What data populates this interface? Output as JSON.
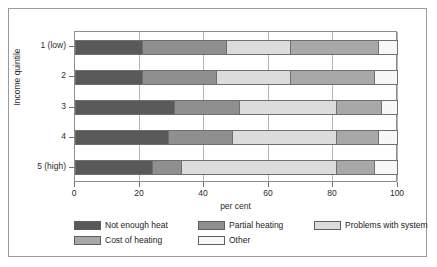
{
  "chart_data": {
    "type": "bar",
    "orientation": "horizontal",
    "stacked": true,
    "title": "",
    "xlabel": "per cent",
    "ylabel": "Income quintile",
    "xlim": [
      0,
      100
    ],
    "xticks": [
      0,
      20,
      40,
      60,
      80,
      100
    ],
    "xticklabels": [
      "0",
      "20",
      "40",
      "60",
      "80",
      "100"
    ],
    "grid": "vertical",
    "legend_position": "bottom",
    "categories": [
      "1 (low)",
      "2",
      "3",
      "4",
      "5 (high)"
    ],
    "series": [
      {
        "name": "Not enough heat",
        "color": "#595959",
        "values": [
          21,
          21,
          31,
          29,
          24
        ]
      },
      {
        "name": "Partial heating",
        "color": "#8f8f8f",
        "values": [
          26,
          23,
          20,
          20,
          9
        ]
      },
      {
        "name": "Problems with system",
        "color": "#dcdcdc",
        "values": [
          20,
          23,
          30,
          32,
          48
        ]
      },
      {
        "name": "Cost of heating",
        "color": "#a8a8a8",
        "values": [
          27,
          26,
          14,
          13,
          12
        ]
      },
      {
        "name": "Other",
        "color": "#f7f7f7",
        "values": [
          6,
          7,
          5,
          6,
          7
        ]
      }
    ]
  },
  "legend": {
    "items": [
      {
        "label": "Not enough heat",
        "color": "#595959"
      },
      {
        "label": "Partial heating",
        "color": "#8f8f8f"
      },
      {
        "label": "Problems with system",
        "color": "#dcdcdc"
      },
      {
        "label": "Cost of heating",
        "color": "#a8a8a8"
      },
      {
        "label": "Other",
        "color": "#f7f7f7"
      }
    ]
  },
  "axes": {
    "x_title": "per cent",
    "y_title": "Income quintile",
    "x_tick_labels": [
      "0",
      "20",
      "40",
      "60",
      "80",
      "100"
    ],
    "y_tick_labels": [
      "1 (low)",
      "2",
      "3",
      "4",
      "5 (high)"
    ]
  },
  "colors": {
    "frame": "#9a9a9a",
    "plot_border": "#8d8d8d",
    "gridline": "#b4b4b4",
    "text": "#2b2b2b",
    "background": "#ffffff"
  }
}
